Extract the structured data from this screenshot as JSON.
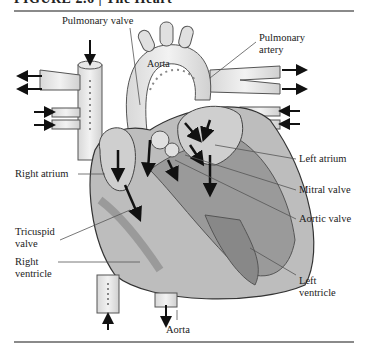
{
  "figure": {
    "header_fragment": "FIGURE 2.6 | The Heart"
  },
  "labels": {
    "pulmonary_valve": "Pulmonary valve",
    "aorta_top": "Aorta",
    "pulmonary_artery_line1": "Pulmonary",
    "pulmonary_artery_line2": "artery",
    "right_atrium": "Right atrium",
    "left_atrium": "Left atrium",
    "mitral_valve": "Mitral valve",
    "aortic_valve": "Aortic valve",
    "tricuspid_valve_line1": "Tricuspid",
    "tricuspid_valve_line2": "valve",
    "right_ventricle_line1": "Right",
    "right_ventricle_line2": "ventricle",
    "left_ventricle_line1": "Left",
    "left_ventricle_line2": "ventricle",
    "aorta_bottom": "Aorta"
  },
  "colors": {
    "heart_body": "#a9a9a9",
    "heart_dark": "#8c8c8c",
    "vessel_light": "#e4e4e4",
    "chamber_light": "#c9c9c9",
    "rule": "#8a8a8a",
    "arrow": "#111111"
  }
}
